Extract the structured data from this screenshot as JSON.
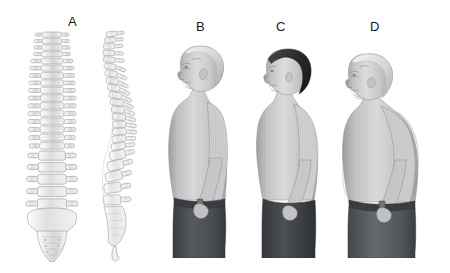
{
  "figure": {
    "background_color": "#ffffff",
    "width": 450,
    "height": 273,
    "style": "grayscale medical illustration"
  },
  "panels": [
    {
      "id": "a",
      "label": "A",
      "label_x": 68,
      "label_y": 14,
      "subject": "vertebral-column",
      "description": "Anterior and lateral views of the human vertebral column",
      "views": [
        {
          "name": "anterior-spine",
          "orientation": "frontal",
          "segments": [
            "cervical",
            "thoracic",
            "lumbar",
            "sacrum"
          ]
        },
        {
          "name": "lateral-spine",
          "orientation": "side",
          "curves": [
            "cervical lordosis",
            "thoracic kyphosis",
            "lumbar lordosis",
            "sacral curve"
          ],
          "segments": [
            "cervical",
            "thoracic",
            "lumbar",
            "sacrum",
            "coccyx"
          ]
        }
      ]
    },
    {
      "id": "b",
      "label": "B",
      "label_x": 196,
      "label_y": 19,
      "subject": "posture-figure",
      "description": "Older man in left-facing profile, bare torso, normal upright posture",
      "hair": "balding, light gray",
      "hair_color": "#d0d0d0",
      "skin_color": "#c9c9c9",
      "trousers_color": "#4a4e52",
      "belt_color": "#3a3d41",
      "posture": "normal spinal curvature"
    },
    {
      "id": "c",
      "label": "C",
      "label_x": 276,
      "label_y": 19,
      "subject": "posture-figure",
      "description": "Woman with short dark hair in left-facing profile, bare torso, mild rounding of upper back",
      "hair": "short dark hair",
      "hair_color": "#2b2b2b",
      "skin_color": "#c9c9c9",
      "trousers_color": "#3f4348",
      "posture": "mild thoracic kyphosis"
    },
    {
      "id": "d",
      "label": "D",
      "label_x": 370,
      "label_y": 19,
      "subject": "posture-figure",
      "description": "Bald older person in left-facing profile with head thrust forward, dorsal hump, protruding abdomen and shortened trunk",
      "hair": "bald, light gray",
      "hair_color": "#d4d4d4",
      "skin_color": "#c9c9c9",
      "trousers_color": "#5a5e63",
      "belt_color": "#3a3d41",
      "posture": "severe thoracic kyphosis with forward head posture"
    }
  ]
}
